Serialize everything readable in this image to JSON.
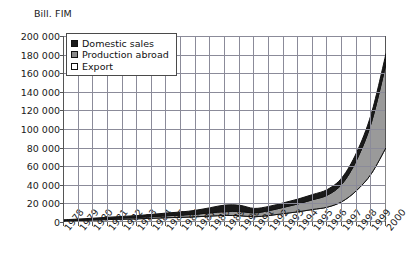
{
  "chart": {
    "type": "area",
    "axis_title": "Bill. FIM",
    "legend": [
      {
        "label": "Domestic sales",
        "color": "#1a1a1a",
        "key": "domestic_sales"
      },
      {
        "label": "Production abroad",
        "color": "#8a8a8a",
        "key": "production_abroad"
      },
      {
        "label": "Export",
        "color": "#ffffff",
        "key": "export"
      }
    ]
  },
  "chart_data": {
    "type": "area",
    "stacked": true,
    "title": "",
    "subtitle": "",
    "xlabel": "",
    "ylabel": "Bill. FIM",
    "ylim": [
      0,
      200000
    ],
    "ytick_step": 20000,
    "grid": true,
    "legend_position": "top-left",
    "categories": [
      "1978",
      "1979",
      "1980",
      "1981",
      "1982",
      "1983",
      "1984",
      "1985",
      "1986",
      "1987",
      "1988",
      "1989",
      "1990",
      "1991",
      "1992",
      "1993",
      "1994",
      "1995",
      "1996",
      "1997",
      "1998",
      "1999",
      "2000"
    ],
    "ytick_labels": [
      "0",
      "20 000",
      "40 000",
      "60 000",
      "80 000",
      "100 000",
      "120 000",
      "140 000",
      "160 000",
      "180 000",
      "200 000"
    ],
    "series": [
      {
        "name": "Export",
        "color": "#ffffff",
        "values": [
          1200,
          1600,
          2100,
          2600,
          3000,
          3400,
          4000,
          4600,
          5000,
          5600,
          6400,
          7000,
          6800,
          5600,
          7000,
          9000,
          11000,
          13500,
          16000,
          22000,
          34000,
          52000,
          80000
        ]
      },
      {
        "name": "Production abroad",
        "color": "#9a9a9a",
        "values": [
          500,
          700,
          900,
          1100,
          1300,
          1500,
          1800,
          2100,
          2400,
          2800,
          3400,
          4200,
          4600,
          4200,
          5200,
          6800,
          8500,
          10500,
          13000,
          19000,
          33000,
          55000,
          90000
        ]
      },
      {
        "name": "Domestic sales",
        "color": "#1a1a1a",
        "values": [
          700,
          900,
          1100,
          1400,
          1700,
          2000,
          2400,
          2900,
          3400,
          4200,
          5600,
          7000,
          6600,
          4800,
          4600,
          4800,
          5200,
          5600,
          6000,
          6800,
          8000,
          9500,
          11000
        ]
      }
    ],
    "totals": [
      2400,
      3200,
      4100,
      5100,
      6000,
      6900,
      8200,
      9600,
      10800,
      12600,
      15400,
      18200,
      18000,
      14600,
      16800,
      20600,
      24700,
      29600,
      35000,
      47800,
      75000,
      116500,
      181000
    ]
  }
}
